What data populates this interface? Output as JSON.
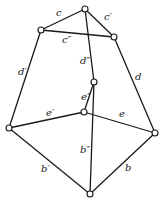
{
  "diagram": {
    "type": "graph",
    "colors": {
      "line": "#1a1a1a",
      "node_fill": "#ffffff",
      "background": "#ffffff"
    },
    "nodes": [
      {
        "id": "apex",
        "x": 85,
        "y": 9
      },
      {
        "id": "upper-left",
        "x": 41,
        "y": 30
      },
      {
        "id": "upper-right",
        "x": 114,
        "y": 37
      },
      {
        "id": "inner-upper",
        "x": 94,
        "y": 82
      },
      {
        "id": "inner-lower",
        "x": 84,
        "y": 112
      },
      {
        "id": "mid-left",
        "x": 9,
        "y": 128
      },
      {
        "id": "mid-right",
        "x": 155,
        "y": 133
      },
      {
        "id": "bottom",
        "x": 90,
        "y": 194
      }
    ],
    "edges": [
      {
        "label": "c",
        "from": "apex",
        "to": "upper-left",
        "lx": 56,
        "ly": 16
      },
      {
        "label": "c′",
        "from": "apex",
        "to": "upper-right",
        "lx": 104,
        "ly": 20
      },
      {
        "label": "c″",
        "from": "upper-left",
        "to": "upper-right",
        "lx": 62,
        "ly": 43
      },
      {
        "label": "d′",
        "from": "upper-left",
        "to": "mid-left",
        "lx": 18,
        "ly": 75
      },
      {
        "label": "d",
        "from": "upper-right",
        "to": "mid-right",
        "lx": 135,
        "ly": 80
      },
      {
        "label": "d″",
        "from": "apex",
        "to": "inner-upper",
        "lx": 80,
        "ly": 64
      },
      {
        "label": "e″",
        "from": "inner-upper",
        "to": "inner-lower",
        "lx": 81,
        "ly": 100
      },
      {
        "label": "e′",
        "from": "mid-left",
        "to": "inner-lower",
        "lx": 46,
        "ly": 116
      },
      {
        "label": "e",
        "from": "inner-lower",
        "to": "mid-right",
        "lx": 119,
        "ly": 117
      },
      {
        "label": "b″",
        "from": "inner-upper",
        "to": "bottom",
        "lx": 80,
        "ly": 153
      },
      {
        "label": "b′",
        "from": "mid-left",
        "to": "bottom",
        "lx": 41,
        "ly": 172
      },
      {
        "label": "b",
        "from": "mid-right",
        "to": "bottom",
        "lx": 125,
        "ly": 171
      }
    ]
  }
}
